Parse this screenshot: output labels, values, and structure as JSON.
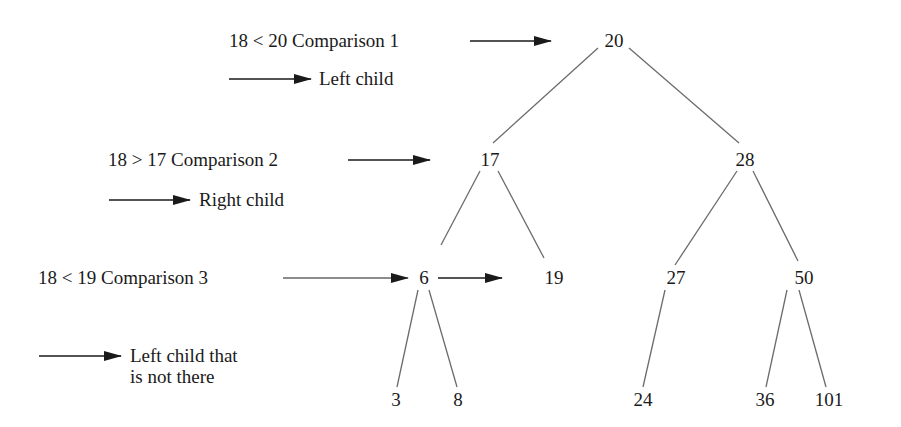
{
  "annotations": {
    "c1": {
      "text": "18  <  20   Comparison 1",
      "result": "Left child"
    },
    "c2": {
      "text": "18  >  17   Comparison 2",
      "result": "Right child"
    },
    "c3": {
      "text": "18  <  19   Comparison 3",
      "result_line1": "Left child that",
      "result_line2": "is not there"
    }
  },
  "tree": {
    "root": "20",
    "n17": "17",
    "n28": "28",
    "n6": "6",
    "n19": "19",
    "n27": "27",
    "n50": "50",
    "n3": "3",
    "n8": "8",
    "n24": "24",
    "n36": "36",
    "n101": "101"
  },
  "colors": {
    "line": "#6b6b6b",
    "arrow": "#1a1a1a",
    "text": "#1a1a1a"
  }
}
